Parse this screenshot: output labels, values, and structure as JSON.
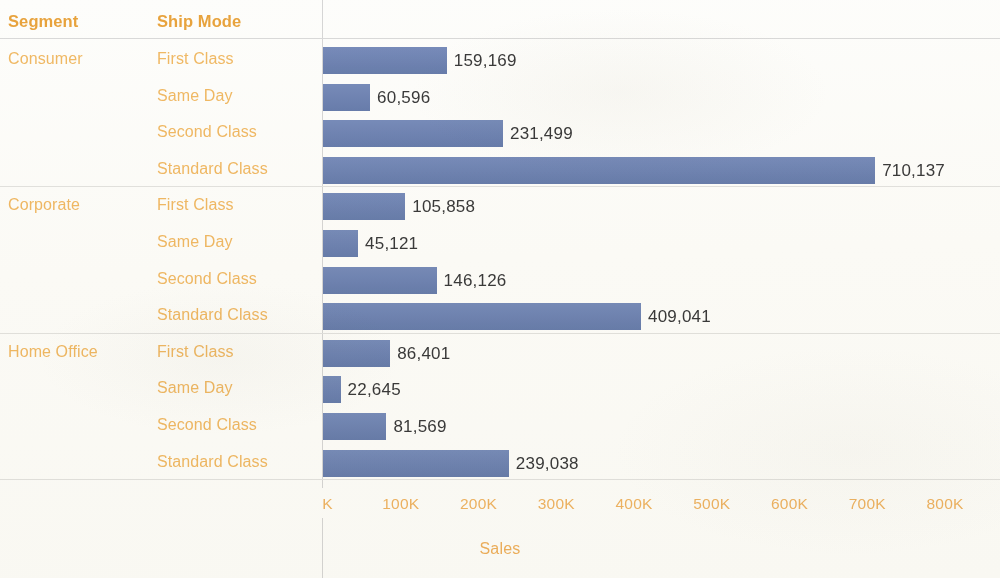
{
  "table": {
    "headers": {
      "segment": "Segment",
      "ship_mode": "Ship Mode"
    }
  },
  "axis": {
    "title": "Sales",
    "ticks": [
      "0K",
      "100K",
      "200K",
      "300K",
      "400K",
      "500K",
      "600K",
      "700K",
      "800K"
    ],
    "tick_values": [
      0,
      100000,
      200000,
      300000,
      400000,
      500000,
      600000,
      700000,
      800000
    ]
  },
  "colors": {
    "bar": "#6d83b5",
    "header_text": "#e8a33d",
    "label_text": "#f0b964",
    "value_text": "#3a3a3a",
    "rule": "#d9d9d9",
    "background": "#fdfdfb"
  },
  "segments": [
    {
      "name": "Consumer",
      "rows": [
        {
          "ship_mode": "First Class",
          "value": 159169,
          "label": "159,169"
        },
        {
          "ship_mode": "Same Day",
          "value": 60596,
          "label": "60,596"
        },
        {
          "ship_mode": "Second Class",
          "value": 231499,
          "label": "231,499"
        },
        {
          "ship_mode": "Standard Class",
          "value": 710137,
          "label": "710,137"
        }
      ]
    },
    {
      "name": "Corporate",
      "rows": [
        {
          "ship_mode": "First Class",
          "value": 105858,
          "label": "105,858"
        },
        {
          "ship_mode": "Same Day",
          "value": 45121,
          "label": "45,121"
        },
        {
          "ship_mode": "Second Class",
          "value": 146126,
          "label": "146,126"
        },
        {
          "ship_mode": "Standard Class",
          "value": 409041,
          "label": "409,041"
        }
      ]
    },
    {
      "name": "Home Office",
      "rows": [
        {
          "ship_mode": "First Class",
          "value": 86401,
          "label": "86,401"
        },
        {
          "ship_mode": "Same Day",
          "value": 22645,
          "label": "22,645"
        },
        {
          "ship_mode": "Second Class",
          "value": 81569,
          "label": "81,569"
        },
        {
          "ship_mode": "Standard Class",
          "value": 239038,
          "label": "239,038"
        }
      ]
    }
  ],
  "chart_data": {
    "type": "bar",
    "orientation": "horizontal",
    "title": "",
    "xlabel": "Sales",
    "ylabel": "",
    "xlim": [
      0,
      800000
    ],
    "grid": false,
    "legend": false,
    "categories": [
      "Consumer / First Class",
      "Consumer / Same Day",
      "Consumer / Second Class",
      "Consumer / Standard Class",
      "Corporate / First Class",
      "Corporate / Same Day",
      "Corporate / Second Class",
      "Corporate / Standard Class",
      "Home Office / First Class",
      "Home Office / Same Day",
      "Home Office / Second Class",
      "Home Office / Standard Class"
    ],
    "values": [
      159169,
      60596,
      231499,
      710137,
      105858,
      45121,
      146126,
      409041,
      86401,
      22645,
      81569,
      239038
    ],
    "data_labels": [
      "159,169",
      "60,596",
      "231,499",
      "710,137",
      "105,858",
      "45,121",
      "146,126",
      "409,041",
      "86,401",
      "22,645",
      "81,569",
      "239,038"
    ],
    "xtick_labels": [
      "0K",
      "100K",
      "200K",
      "300K",
      "400K",
      "500K",
      "600K",
      "700K",
      "800K"
    ],
    "xticks": [
      0,
      100000,
      200000,
      300000,
      400000,
      500000,
      600000,
      700000,
      800000
    ],
    "bar_color": "#6d83b5"
  }
}
